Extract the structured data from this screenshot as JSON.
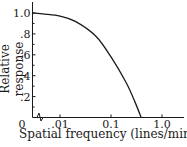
{
  "chart_data": {
    "type": "line",
    "title": "",
    "xlabel": "Spatial frequency (lines/minute)",
    "ylabel": "Relative response",
    "x_scale": "log",
    "x_ticks": [
      "0",
      ".01",
      "0.1",
      "1.0"
    ],
    "y_ticks": [
      "0",
      ".2",
      ".4",
      ".6",
      ".8",
      "1.0"
    ],
    "ylim": [
      0,
      1.0
    ],
    "xlim": [
      0.003,
      2.0
    ],
    "axis_break": "x-axis break between 0 and .01",
    "grid": false,
    "legend": null,
    "series": [
      {
        "name": "Relative response",
        "x": [
          0.003,
          0.005,
          0.01,
          0.02,
          0.05,
          0.1,
          0.2,
          0.3,
          0.39
        ],
        "y": [
          1.0,
          0.99,
          0.97,
          0.92,
          0.78,
          0.58,
          0.33,
          0.14,
          0.0
        ]
      }
    ]
  },
  "labels": {
    "xlabel": "Spatial frequency (lines/minute)",
    "ylabel": "Relative response"
  }
}
